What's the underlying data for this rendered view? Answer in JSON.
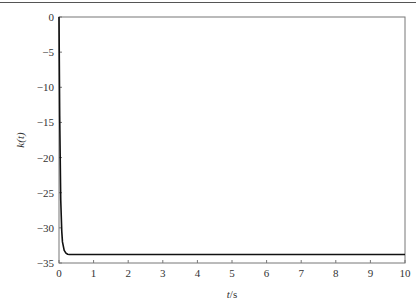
{
  "chart_data": {
    "type": "line",
    "title": "",
    "xlabel": "t/s",
    "ylabel": "k(t)",
    "xlim": [
      0,
      10
    ],
    "ylim": [
      -35,
      0
    ],
    "grid": false,
    "legend": null,
    "x_ticks": [
      0,
      1,
      2,
      3,
      4,
      5,
      6,
      7,
      8,
      9,
      10
    ],
    "y_ticks": [
      0,
      -5,
      -10,
      -15,
      -20,
      -25,
      -30,
      -35
    ],
    "series": [
      {
        "name": "k(t)",
        "color": "#111111",
        "x": [
          0,
          0.02,
          0.05,
          0.08,
          0.1,
          0.15,
          0.2,
          0.25,
          0.3,
          0.4,
          0.5,
          1,
          2,
          3,
          4,
          5,
          6,
          7,
          8,
          9,
          10
        ],
        "y": [
          0,
          -14,
          -26,
          -30.5,
          -32,
          -33.2,
          -33.6,
          -33.75,
          -33.8,
          -33.8,
          -33.8,
          -33.8,
          -33.8,
          -33.8,
          -33.8,
          -33.8,
          -33.8,
          -33.8,
          -33.8,
          -33.8,
          -33.8
        ]
      }
    ]
  },
  "labels": {
    "xlabel_italic": "t",
    "xlabel_unit": "/s",
    "ylabel": "k(t)"
  }
}
